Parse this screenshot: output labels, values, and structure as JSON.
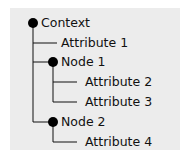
{
  "tree": {
    "root": {
      "label": "Context"
    },
    "nodes": [
      {
        "label": "Attribute 1",
        "type": "attribute",
        "depth": 1
      },
      {
        "label": "Node 1",
        "type": "node",
        "depth": 1
      },
      {
        "label": "Attribute 2",
        "type": "attribute",
        "depth": 2
      },
      {
        "label": "Attribute 3",
        "type": "attribute",
        "depth": 2
      },
      {
        "label": "Node 2",
        "type": "node",
        "depth": 1
      },
      {
        "label": "Attribute 4",
        "type": "attribute",
        "depth": 2
      }
    ]
  },
  "colors": {
    "panel": "#ececec",
    "line": "#111111",
    "dot": "#000000",
    "text": "#111111"
  }
}
